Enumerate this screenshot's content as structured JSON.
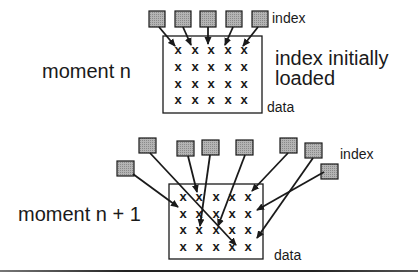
{
  "top": {
    "moment_label": "moment n",
    "index_label": "index",
    "note_line1": "index initially",
    "note_line2": "loaded",
    "data_label": "data",
    "grid": {
      "rows": 4,
      "cols": 5,
      "mark": "x"
    }
  },
  "bottom": {
    "moment_label": "moment n + 1",
    "index_label": "index",
    "data_label": "data",
    "grid": {
      "rows": 4,
      "cols": 5,
      "mark": "x"
    }
  },
  "colors": {
    "index_fill": "#a8a8a8",
    "stroke": "#1a1a1a"
  }
}
